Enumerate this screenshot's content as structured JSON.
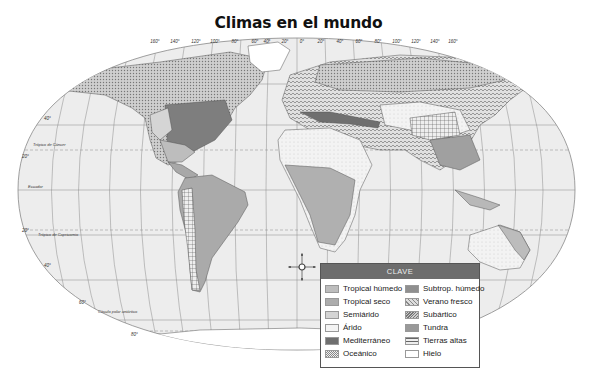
{
  "title": "Climas en el mundo",
  "map": {
    "longitude_labels_west": [
      "160°",
      "140°",
      "120°",
      "100°",
      "80°",
      "60°",
      "40°",
      "20°"
    ],
    "center_meridian": "0°",
    "longitude_labels_east": [
      "20°",
      "40°",
      "60°",
      "80°",
      "100°",
      "120°",
      "140°",
      "160°"
    ],
    "latitude_labels": {
      "lat40n": "40°",
      "lat20n": "20°",
      "lat20s": "20°",
      "lat40s": "40°",
      "lat60s": "60°",
      "lat80s": "80°"
    },
    "reference_lines": {
      "cancer": "Trópico de Cáncer",
      "equator": "Ecuador",
      "capricorn": "Trópico de Capricornio",
      "antarctic": "Círculo polar antártico"
    },
    "compass": {
      "n": "N",
      "s": "S",
      "e": "E",
      "o": "O"
    }
  },
  "legend": {
    "title": "CLAVE",
    "items": [
      {
        "label": "Tropical húmedo",
        "color": "#bdbdbd",
        "pattern": "dots"
      },
      {
        "label": "Subtrop. húmedo",
        "color": "#8f8f8f",
        "pattern": "solid"
      },
      {
        "label": "Tropical seco",
        "color": "#acacac",
        "pattern": "solid"
      },
      {
        "label": "Verano fresco",
        "color": "#d6d6d6",
        "pattern": "waves"
      },
      {
        "label": "Semiárido",
        "color": "#d4d4d4",
        "pattern": "solid"
      },
      {
        "label": "Subártico",
        "color": "#c8c8c8",
        "pattern": "waves"
      },
      {
        "label": "Árido",
        "color": "#efefef",
        "pattern": "dots"
      },
      {
        "label": "Tundra",
        "color": "#999999",
        "pattern": "solid"
      },
      {
        "label": "Mediterráneo",
        "color": "#6f6f6f",
        "pattern": "solid"
      },
      {
        "label": "Tierras altas",
        "color": "#dcdcdc",
        "pattern": "grid"
      },
      {
        "label": "Oceánico",
        "color": "#cfcfcf",
        "pattern": "checker"
      },
      {
        "label": "Hielo",
        "color": "#ffffff",
        "pattern": "solid"
      }
    ]
  }
}
